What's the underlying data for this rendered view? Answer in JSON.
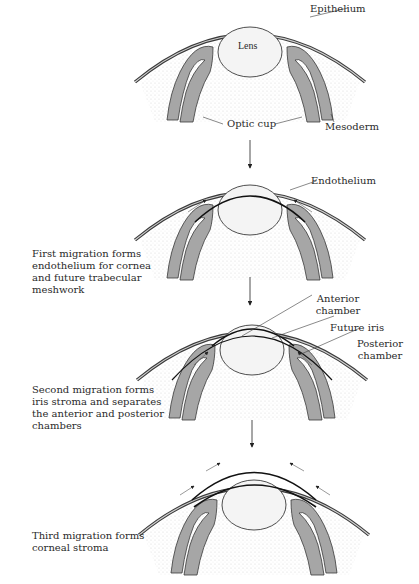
{
  "panels": [
    {
      "id": "stage-0",
      "labels": {
        "lens": "Lens",
        "epithelium": "Epithelium",
        "optic_cup": "Optic cup",
        "mesoderm": "Mesoderm"
      }
    },
    {
      "id": "stage-1",
      "labels": {
        "endothelium": "Endothelium"
      },
      "caption": "First migration forms endothelium for cornea and future trabecular meshwork"
    },
    {
      "id": "stage-2",
      "labels": {
        "anterior_chamber": "Anterior chamber",
        "future_iris": "Future iris",
        "posterior_chamber": "Posterior chamber"
      },
      "caption": "Second migration forms iris stroma and separates the anterior and posterior chambers"
    },
    {
      "id": "stage-3",
      "caption": "Third migration forms corneal stroma"
    }
  ],
  "colors": {
    "cup_fill": "#a6a6a6",
    "outline": "#3a3a3a",
    "mesoderm_dots": "#d0d0d0",
    "lens_fill": "#f4f4f4"
  }
}
